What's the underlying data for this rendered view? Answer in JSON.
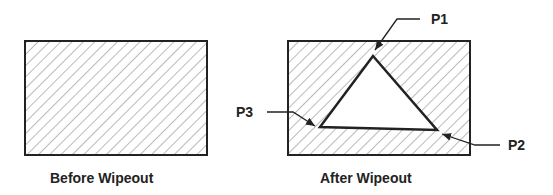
{
  "diagram": {
    "before": {
      "caption": "Before Wipeout",
      "rect": {
        "x": 25,
        "y": 41,
        "w": 182,
        "h": 114
      }
    },
    "after": {
      "caption": "After Wipeout",
      "rect": {
        "x": 288,
        "y": 41,
        "w": 182,
        "h": 114
      },
      "points": [
        {
          "label": "P1",
          "x": 373,
          "y": 56
        },
        {
          "label": "P2",
          "x": 437,
          "y": 130
        },
        {
          "label": "P3",
          "x": 320,
          "y": 127
        }
      ]
    },
    "colors": {
      "stroke": "#222222",
      "hatch": "#555555",
      "background": "#ffffff"
    }
  }
}
